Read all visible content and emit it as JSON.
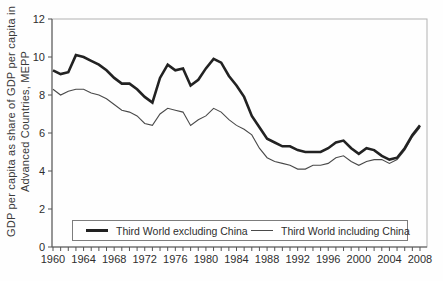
{
  "figure": {
    "ylabel_line1": "GDP per capita as share of GDP per capita in",
    "ylabel_line2": "Advanced Countries, MEPP"
  },
  "legend": {
    "excluding_label": "Third World excluding China",
    "including_label": "Third World including China"
  },
  "colors": {
    "thick_line": "#222222",
    "thin_line": "#4a4a4a",
    "axis": "#555555",
    "frame": "#b2b2b2",
    "tick_text": "#2e2e2e",
    "background": "#fefefe"
  },
  "chart_data": {
    "type": "line",
    "title": "",
    "xlabel": "",
    "ylabel": "GDP per capita as share of GDP per capita in Advanced Countries, MEPP",
    "ylim": [
      0,
      12
    ],
    "xlim": [
      1960,
      2009
    ],
    "grid": false,
    "legend_position": "bottom-inside",
    "y_ticks": [
      0,
      2,
      4,
      6,
      8,
      10,
      12
    ],
    "x_tick_labels": [
      1960,
      1964,
      1968,
      1972,
      1976,
      1980,
      1984,
      1988,
      1992,
      1996,
      2000,
      2004,
      2008
    ],
    "x": [
      1960,
      1961,
      1962,
      1963,
      1964,
      1965,
      1966,
      1967,
      1968,
      1969,
      1970,
      1971,
      1972,
      1973,
      1974,
      1975,
      1976,
      1977,
      1978,
      1979,
      1980,
      1981,
      1982,
      1983,
      1984,
      1985,
      1986,
      1987,
      1988,
      1989,
      1990,
      1991,
      1992,
      1993,
      1994,
      1995,
      1996,
      1997,
      1998,
      1999,
      2000,
      2001,
      2002,
      2003,
      2004,
      2005,
      2006,
      2007,
      2008
    ],
    "series": [
      {
        "name": "Third World excluding China",
        "style": "thick",
        "values": [
          9.3,
          9.1,
          9.2,
          10.1,
          10.0,
          9.8,
          9.6,
          9.3,
          8.9,
          8.6,
          8.6,
          8.3,
          7.9,
          7.6,
          8.9,
          9.6,
          9.3,
          9.4,
          8.5,
          8.8,
          9.4,
          9.9,
          9.7,
          9.0,
          8.5,
          7.9,
          6.9,
          6.3,
          5.7,
          5.5,
          5.3,
          5.3,
          5.1,
          5.0,
          5.0,
          5.0,
          5.2,
          5.5,
          5.6,
          5.2,
          4.9,
          5.2,
          5.1,
          4.8,
          4.6,
          4.7,
          5.2,
          5.9,
          6.4
        ]
      },
      {
        "name": "Third World including China",
        "style": "thin",
        "values": [
          8.3,
          8.0,
          8.2,
          8.3,
          8.3,
          8.1,
          8.0,
          7.8,
          7.5,
          7.2,
          7.1,
          6.9,
          6.5,
          6.4,
          7.0,
          7.3,
          7.2,
          7.1,
          6.4,
          6.7,
          6.9,
          7.3,
          7.1,
          6.7,
          6.4,
          6.2,
          5.9,
          5.2,
          4.7,
          4.5,
          4.4,
          4.3,
          4.1,
          4.1,
          4.3,
          4.3,
          4.4,
          4.7,
          4.8,
          4.5,
          4.3,
          4.5,
          4.6,
          4.6,
          4.4,
          4.6,
          5.1,
          5.8,
          6.3
        ]
      }
    ]
  }
}
